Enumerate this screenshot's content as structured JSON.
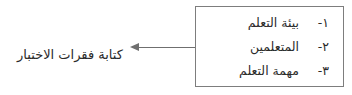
{
  "diagram": {
    "left_caption": "كتابة فقرات الاختبار",
    "arrow": {
      "direction": "left",
      "icon": "arrow-left-icon"
    },
    "box": {
      "items": [
        {
          "number": "١-",
          "label": "بيئة التعلم"
        },
        {
          "number": "٢-",
          "label": "المتعلمين"
        },
        {
          "number": "٣-",
          "label": "مهمة التعلم"
        }
      ]
    },
    "colors": {
      "border": "#7d7d7d",
      "arrow": "#6f6f6f",
      "text": "#2b2b2b",
      "background": "#ffffff"
    }
  }
}
